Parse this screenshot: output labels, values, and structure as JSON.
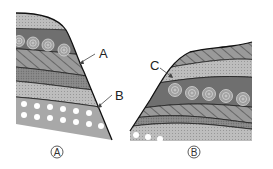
{
  "diagram": {
    "outcrops": [
      {
        "id": "A",
        "caption": "A",
        "caption_symbol": "Ⓐ"
      },
      {
        "id": "B",
        "caption": "B",
        "caption_symbol": "Ⓑ"
      }
    ],
    "pointer_labels": [
      {
        "text": "A",
        "outcrop": "A",
        "target": "boundary between hatched layer and circles layer"
      },
      {
        "text": "B",
        "outcrop": "A",
        "target": "boundary between sandstone and pebble layer"
      },
      {
        "text": "C",
        "outcrop": "B",
        "target": "boundary between dotted layer and circles layer"
      }
    ],
    "layers_A_top_to_bottom": [
      "fine dotted (sandstone)",
      "concentric circles (fossil/ooid)",
      "diagonal hatching (shale)",
      "dense dotted (dark)",
      "fine dotted (sandstone)",
      "white dots (conglomerate)"
    ],
    "layers_B_top_to_bottom": [
      "diagonal hatching",
      "fine dotted",
      "concentric circles",
      "diagonal hatching",
      "dense dotted (dark)",
      "fine dotted"
    ],
    "colors": {
      "layer_light": "#b8b8b8",
      "layer_dark": "#7a7a7a",
      "layer_medium": "#999999",
      "outline": "#222222",
      "background": "#ffffff"
    }
  }
}
